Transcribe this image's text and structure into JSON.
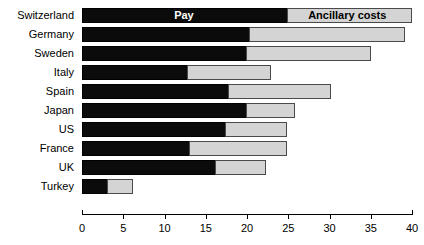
{
  "chart_data": {
    "type": "bar",
    "orientation": "horizontal",
    "stacked": true,
    "title": "",
    "subtitle": "",
    "xlabel": "",
    "ylabel": "",
    "categories": [
      "Switzerland",
      "Germany",
      "Sweden",
      "Italy",
      "Spain",
      "Japan",
      "US",
      "France",
      "UK",
      "Turkey"
    ],
    "series": [
      {
        "name": "Pay",
        "color": "#0b0b0b",
        "values": [
          25.0,
          20.4,
          20.0,
          12.9,
          17.8,
          20.0,
          17.4,
          13.1,
          16.3,
          3.2
        ]
      },
      {
        "name": "Ancillary costs",
        "color": "#d4d4d4",
        "values": [
          15.0,
          18.7,
          15.0,
          10.0,
          12.4,
          5.8,
          7.5,
          11.8,
          6.0,
          3.0
        ]
      }
    ],
    "totals": [
      40.0,
      39.1,
      35.0,
      22.9,
      30.2,
      25.8,
      24.9,
      24.9,
      22.3,
      6.2
    ],
    "xlim": [
      0,
      40
    ],
    "xticks": [
      0,
      5,
      10,
      15,
      20,
      25,
      30,
      35,
      40
    ],
    "xtick_labels": [
      "0",
      "5",
      "10",
      "15",
      "20",
      "25",
      "30",
      "35",
      "40"
    ],
    "grid": false,
    "legend_position": "inside-first-bar",
    "legend": [
      {
        "label": "Pay",
        "color": "#0b0b0b",
        "text_color": "#ffffff"
      },
      {
        "label": "Ancillary costs",
        "color": "#d4d4d4",
        "text_color": "#000000"
      }
    ]
  },
  "axis": {
    "baseline_color": "#000000"
  }
}
